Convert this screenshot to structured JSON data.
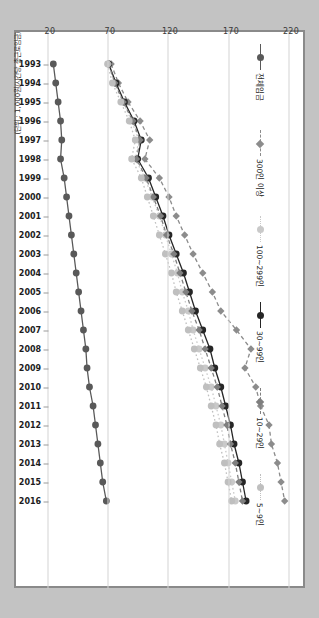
{
  "unit_note": "(단위 : 1,000원/시간당 총근로임금)",
  "legend": {
    "items": [
      {
        "label": "전체임금",
        "color": "#595959",
        "marker": "circle",
        "dash": "solid"
      },
      {
        "label": "300인 이상",
        "color": "#8c8c8c",
        "marker": "diamond",
        "dash": "dash"
      },
      {
        "label": "100~299인",
        "color": "#c9c9c9",
        "marker": "circle",
        "dash": "dot"
      },
      {
        "label": "30~99인",
        "color": "#262626",
        "marker": "circle",
        "dash": "solid"
      },
      {
        "label": "10~29인",
        "color": "#7f7f7f",
        "marker": "diamond",
        "dash": "dash"
      },
      {
        "label": "5~9인",
        "color": "#bfbfbf",
        "marker": "circle",
        "dash": "dot"
      }
    ]
  },
  "chart_data": {
    "type": "line",
    "title": "",
    "xlabel": "",
    "ylabel": "(단위 : 1,000원/시간당 총근로임금)",
    "orientation": "rotated-90",
    "grid": true,
    "legend_position": "right",
    "ylim": [
      20,
      220
    ],
    "yticks": [
      220,
      170,
      120,
      70,
      20
    ],
    "categories": [
      "1993",
      "1994",
      "1995",
      "1996",
      "1997",
      "1998",
      "1999",
      "2000",
      "2001",
      "2002",
      "2003",
      "2004",
      "2005",
      "2006",
      "2007",
      "2008",
      "2009",
      "2010",
      "2011",
      "2012",
      "2013",
      "2014",
      "2015",
      "2016"
    ],
    "series": [
      {
        "name": "전체임금",
        "color": "#595959",
        "marker": "circle",
        "dash": "solid",
        "values": [
          24,
          26,
          28,
          30,
          31,
          30,
          33,
          35,
          37,
          39,
          41,
          43,
          45,
          47,
          49,
          51,
          52,
          54,
          57,
          59,
          61,
          63,
          65,
          68
        ]
      },
      {
        "name": "300인 이상",
        "color": "#8c8c8c",
        "marker": "diamond",
        "dash": "dash",
        "values": [
          72,
          78,
          86,
          96,
          104,
          100,
          112,
          120,
          126,
          133,
          140,
          148,
          156,
          163,
          176,
          188,
          183,
          192,
          196,
          203,
          205,
          210,
          213,
          216
        ]
      },
      {
        "name": "100~299인",
        "color": "#c9c9c9",
        "marker": "circle",
        "dash": "dot",
        "values": [
          70,
          75,
          82,
          89,
          95,
          92,
          100,
          106,
          112,
          117,
          122,
          127,
          131,
          136,
          140,
          145,
          150,
          155,
          159,
          163,
          166,
          169,
          172,
          175
        ]
      },
      {
        "name": "30~99인",
        "color": "#262626",
        "marker": "circle",
        "dash": "solid",
        "values": [
          70,
          76,
          83,
          91,
          97,
          94,
          103,
          109,
          115,
          120,
          126,
          132,
          137,
          142,
          148,
          154,
          158,
          163,
          167,
          171,
          174,
          178,
          181,
          184
        ]
      },
      {
        "name": "10~29인",
        "color": "#7f7f7f",
        "marker": "diamond",
        "dash": "dash",
        "values": [
          70,
          75,
          82,
          90,
          96,
          93,
          101,
          107,
          113,
          118,
          124,
          129,
          134,
          139,
          145,
          150,
          155,
          160,
          164,
          168,
          171,
          175,
          178,
          181
        ]
      },
      {
        "name": "5~9인",
        "color": "#bfbfbf",
        "marker": "circle",
        "dash": "dot",
        "values": [
          69,
          73,
          80,
          87,
          92,
          89,
          97,
          102,
          107,
          112,
          117,
          122,
          126,
          131,
          136,
          141,
          146,
          151,
          155,
          159,
          162,
          166,
          169,
          172
        ]
      }
    ]
  }
}
